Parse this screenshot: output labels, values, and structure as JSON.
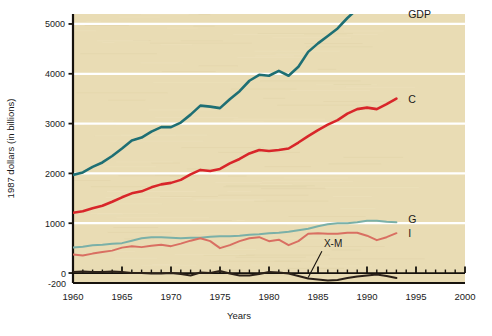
{
  "chart_data": {
    "type": "line",
    "title": "",
    "xlabel": "Years",
    "ylabel": "1987 dollars (in billions)",
    "xlim": [
      1960,
      2000
    ],
    "ylim": [
      -200,
      5200
    ],
    "xticks": [
      1960,
      1965,
      1970,
      1975,
      1980,
      1985,
      1990,
      1995,
      2000
    ],
    "xtick_labels": [
      "1960",
      "1965",
      "1970",
      "1975",
      "1980",
      "1985",
      "1990",
      "1995",
      "2000"
    ],
    "xminor_step": 1,
    "yticks": [
      -200,
      0,
      1000,
      2000,
      3000,
      4000,
      5000
    ],
    "ytick_labels": [
      "-200",
      "0",
      "1000",
      "2000",
      "3000",
      "4000",
      "5000"
    ],
    "gridlines": [
      1000,
      2000,
      3000,
      4000,
      5000
    ],
    "grid": true,
    "grid_color": "#ffffff",
    "plot_background": "#e9dcb4",
    "legend_position": "right-inline",
    "x": [
      1960,
      1961,
      1962,
      1963,
      1964,
      1965,
      1966,
      1967,
      1968,
      1969,
      1970,
      1971,
      1972,
      1973,
      1974,
      1975,
      1976,
      1977,
      1978,
      1979,
      1980,
      1981,
      1982,
      1983,
      1984,
      1985,
      1986,
      1987,
      1988,
      1989,
      1990,
      1991,
      1992,
      1993
    ],
    "series": [
      {
        "name": "GDP",
        "label": "GDP",
        "color": "#1e6f74",
        "width": 2.6,
        "values": [
          1970,
          2020,
          2130,
          2220,
          2350,
          2500,
          2660,
          2720,
          2840,
          2930,
          2930,
          3020,
          3180,
          3360,
          3340,
          3310,
          3490,
          3650,
          3860,
          3980,
          3960,
          4060,
          3960,
          4140,
          4440,
          4610,
          4760,
          4910,
          5120,
          5300,
          5390,
          5330,
          5470,
          5570
        ]
      },
      {
        "name": "C",
        "label": "C",
        "color": "#d8262a",
        "width": 2.6,
        "values": [
          1210,
          1240,
          1300,
          1350,
          1430,
          1520,
          1600,
          1640,
          1720,
          1780,
          1810,
          1870,
          1980,
          2070,
          2050,
          2090,
          2200,
          2290,
          2400,
          2470,
          2450,
          2470,
          2500,
          2620,
          2750,
          2870,
          2980,
          3070,
          3200,
          3290,
          3320,
          3290,
          3390,
          3500
        ]
      },
      {
        "name": "G",
        "label": "G",
        "color": "#7ab0a8",
        "width": 2.0,
        "values": [
          510,
          530,
          560,
          570,
          590,
          600,
          650,
          700,
          720,
          720,
          710,
          700,
          710,
          710,
          730,
          740,
          740,
          750,
          770,
          780,
          800,
          810,
          830,
          860,
          890,
          940,
          980,
          1000,
          1000,
          1020,
          1050,
          1050,
          1030,
          1020
        ]
      },
      {
        "name": "I",
        "label": "I",
        "color": "#d96f62",
        "width": 2.0,
        "values": [
          370,
          350,
          390,
          420,
          450,
          510,
          540,
          520,
          550,
          570,
          540,
          590,
          650,
          700,
          640,
          500,
          560,
          640,
          700,
          720,
          640,
          670,
          560,
          640,
          790,
          800,
          790,
          790,
          810,
          810,
          750,
          660,
          720,
          800
        ]
      },
      {
        "name": "X-M",
        "label": "X-M",
        "color": "#2b2118",
        "width": 2.0,
        "values": [
          20,
          30,
          20,
          20,
          30,
          20,
          0,
          0,
          -10,
          -10,
          0,
          -20,
          -50,
          10,
          0,
          40,
          -10,
          -50,
          -50,
          -20,
          20,
          10,
          -10,
          -60,
          -110,
          -130,
          -150,
          -140,
          -100,
          -70,
          -50,
          -30,
          -60,
          -100
        ]
      }
    ],
    "annotations": [
      {
        "name": "x-m-callout",
        "text": "X-M",
        "x": 1985.6,
        "y": 520,
        "leader_to_x": 1984.0,
        "leader_to_y": -110
      }
    ],
    "inline_labels": [
      {
        "name": "gdp-label",
        "text": "GDP",
        "x": 1994.2,
        "y": 5180
      },
      {
        "name": "c-label",
        "text": "C",
        "x": 1994.2,
        "y": 3480
      },
      {
        "name": "g-label",
        "text": "G",
        "x": 1994.2,
        "y": 1070
      },
      {
        "name": "i-label",
        "text": "I",
        "x": 1994.2,
        "y": 790
      }
    ]
  }
}
